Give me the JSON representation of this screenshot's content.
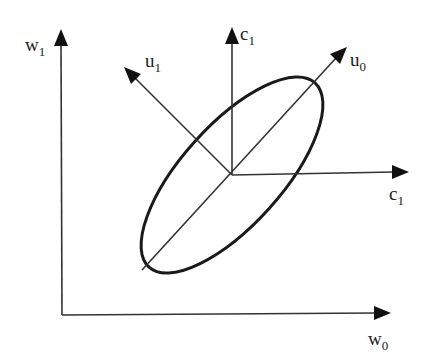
{
  "diagram": {
    "outer_axes": {
      "horizontal": {
        "base": "w",
        "sub": "0"
      },
      "vertical": {
        "base": "w",
        "sub": "1"
      }
    },
    "inner_axes": {
      "horizontal": {
        "base": "c",
        "sub": "1"
      },
      "vertical": {
        "base": "c",
        "sub": "1"
      }
    },
    "principal_axes": {
      "major": {
        "base": "u",
        "sub": "0"
      },
      "minor": {
        "base": "u",
        "sub": "1"
      }
    },
    "colors": {
      "line": "#333333",
      "ellipse": "#1a1a1a",
      "background": "#ffffff"
    }
  }
}
